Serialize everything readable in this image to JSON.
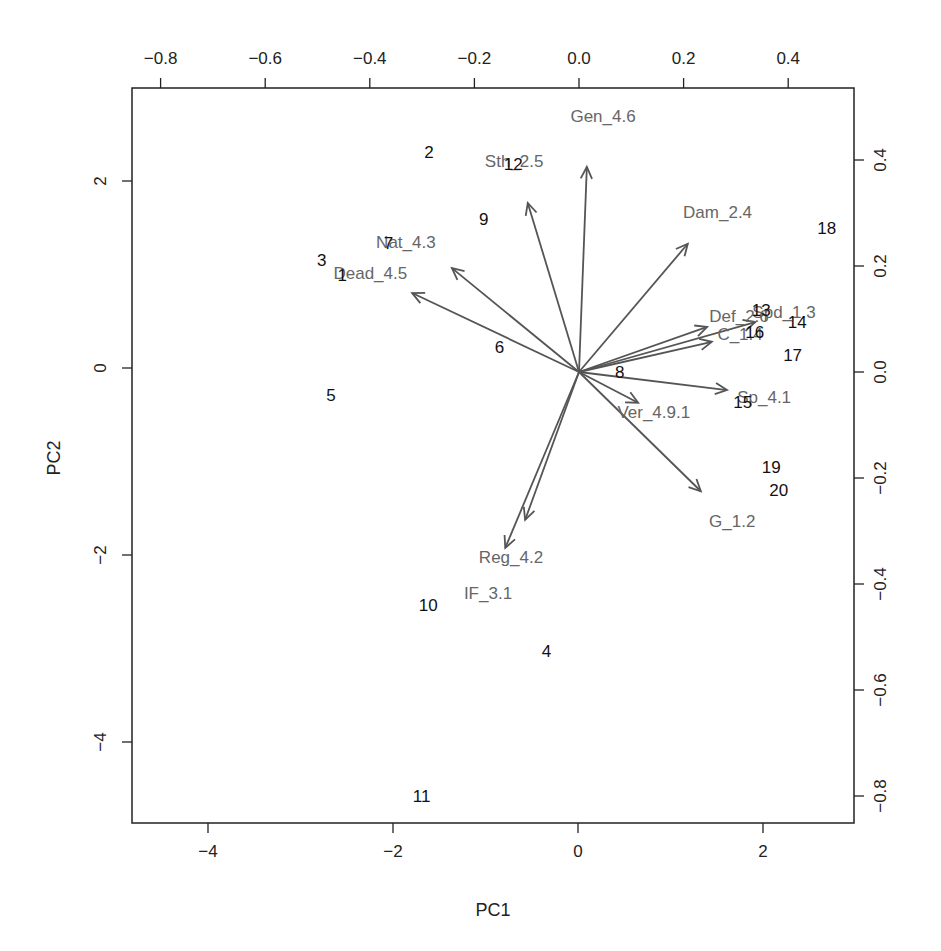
{
  "chart_data": {
    "type": "scatter",
    "subtype": "pca-biplot",
    "title": "",
    "xlabel": "PC1",
    "ylabel": "PC2",
    "xlim": [
      -4.9,
      3.0
    ],
    "ylim": [
      -4.9,
      3.0
    ],
    "x_ticks": [
      -4,
      -2,
      0,
      2
    ],
    "y_ticks": [
      -4,
      -2,
      0,
      2
    ],
    "secondary_x_ticks": [
      -0.8,
      -0.6,
      -0.4,
      -0.2,
      0.0,
      0.2,
      0.4
    ],
    "secondary_y_ticks": [
      -0.8,
      -0.6,
      -0.4,
      -0.2,
      0.0,
      0.2,
      0.4
    ],
    "secondary_x_tick_labels": [
      "−0.8",
      "−0.6",
      "−0.4",
      "−0.2",
      "0.0",
      "0.2",
      "0.4"
    ],
    "secondary_y_tick_labels": [
      "−0.8",
      "−0.6",
      "−0.4",
      "−0.2",
      "0.0",
      "0.2",
      "0.4"
    ],
    "x_tick_labels": [
      "−4",
      "−2",
      "0",
      "2"
    ],
    "y_tick_labels": [
      "−4",
      "−2",
      "0",
      "2"
    ],
    "grid": false,
    "legend": null,
    "observations": [
      {
        "label": "1",
        "pc1": -2.55,
        "pc2": 0.99
      },
      {
        "label": "2",
        "pc1": -1.61,
        "pc2": 2.31
      },
      {
        "label": "3",
        "pc1": -2.77,
        "pc2": 1.16
      },
      {
        "label": "4",
        "pc1": -0.34,
        "pc2": -3.03
      },
      {
        "label": "5",
        "pc1": -2.67,
        "pc2": -0.29
      },
      {
        "label": "6",
        "pc1": -0.85,
        "pc2": 0.22
      },
      {
        "label": "7",
        "pc1": -2.05,
        "pc2": 1.34
      },
      {
        "label": "8",
        "pc1": 0.45,
        "pc2": -0.04
      },
      {
        "label": "9",
        "pc1": -1.02,
        "pc2": 1.59
      },
      {
        "label": "10",
        "pc1": -1.62,
        "pc2": -2.53
      },
      {
        "label": "11",
        "pc1": -1.69,
        "pc2": -4.58
      },
      {
        "label": "12",
        "pc1": -0.7,
        "pc2": 2.18
      },
      {
        "label": "13",
        "pc1": 1.98,
        "pc2": 0.62
      },
      {
        "label": "14",
        "pc1": 2.37,
        "pc2": 0.49
      },
      {
        "label": "15",
        "pc1": 1.78,
        "pc2": -0.36
      },
      {
        "label": "16",
        "pc1": 1.91,
        "pc2": 0.39
      },
      {
        "label": "17",
        "pc1": 2.32,
        "pc2": 0.14
      },
      {
        "label": "18",
        "pc1": 2.69,
        "pc2": 1.5
      },
      {
        "label": "19",
        "pc1": 2.09,
        "pc2": -1.06
      },
      {
        "label": "20",
        "pc1": 2.17,
        "pc2": -1.3
      }
    ],
    "loadings": [
      {
        "label": "Gen_4.6",
        "pc1": 0.015,
        "pc2": 0.387,
        "lx": 0.046,
        "ly": 0.483
      },
      {
        "label": "Sth_2.5",
        "pc1": -0.098,
        "pc2": 0.319,
        "lx": -0.124,
        "ly": 0.398
      },
      {
        "label": "Dam_2.4",
        "pc1": 0.208,
        "pc2": 0.242,
        "lx": 0.265,
        "ly": 0.302
      },
      {
        "label": "Nat_4.3",
        "pc1": -0.243,
        "pc2": 0.196,
        "lx": -0.331,
        "ly": 0.245
      },
      {
        "label": "Dead_4.5",
        "pc1": -0.319,
        "pc2": 0.149,
        "lx": -0.399,
        "ly": 0.187
      },
      {
        "label": "Def_2.6",
        "pc1": 0.245,
        "pc2": 0.085,
        "lx": 0.306,
        "ly": 0.106
      },
      {
        "label": "Spd_1.3",
        "pc1": 0.337,
        "pc2": 0.094,
        "lx": 0.392,
        "ly": 0.113
      },
      {
        "label": "C_1.4",
        "pc1": 0.254,
        "pc2": 0.057,
        "lx": 0.308,
        "ly": 0.072
      },
      {
        "label": "Sp_4.1",
        "pc1": 0.283,
        "pc2": -0.034,
        "lx": 0.354,
        "ly": -0.047
      },
      {
        "label": "Ver_4.9.1",
        "pc1": 0.113,
        "pc2": -0.058,
        "lx": 0.143,
        "ly": -0.075
      },
      {
        "label": "G_1.2",
        "pc1": 0.233,
        "pc2": -0.225,
        "lx": 0.293,
        "ly": -0.281
      },
      {
        "label": "IF_3.1",
        "pc1": -0.103,
        "pc2": -0.279,
        "lx": -0.174,
        "ly": -0.417
      },
      {
        "label": "Reg_4.2",
        "pc1": -0.141,
        "pc2": -0.332,
        "lx": -0.13,
        "ly": -0.349
      }
    ],
    "colors": {
      "observations": "#111111",
      "loadings": "#555555",
      "loading_labels": "#666666",
      "axes": "#222222"
    }
  }
}
